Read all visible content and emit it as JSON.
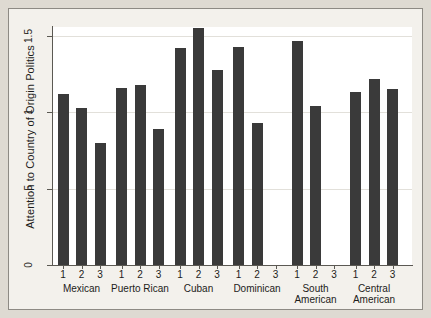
{
  "chart_data": {
    "type": "bar",
    "title": "",
    "subtitle": "",
    "xlabel": "",
    "ylabel": "Attention to Country of Origin Politics",
    "ylim": [
      0,
      1.65
    ],
    "ytick_values": [
      0,
      0.5,
      1,
      1.5
    ],
    "ytick_labels": [
      "0",
      ".5",
      "1",
      "1.5"
    ],
    "grid": "horizontal",
    "legend": "none",
    "bar_color": "#3a3a3a",
    "plot_background": "#ffffff",
    "figure_background": "#dedad2",
    "panel_background": "#f3f1ec",
    "categories": [
      "Mexican",
      "Puerto Rican",
      "Cuban",
      "Dominican",
      "South American",
      "Central American"
    ],
    "subcategories": [
      "1",
      "2",
      "3"
    ],
    "groups": [
      {
        "label": "Mexican",
        "label_lines": [
          "Mexican"
        ],
        "bars": [
          {
            "tick": "1",
            "value": 1.12
          },
          {
            "tick": "2",
            "value": 1.03
          },
          {
            "tick": "3",
            "value": 0.8
          }
        ]
      },
      {
        "label": "Puerto Rican",
        "label_lines": [
          "Puerto Rican"
        ],
        "bars": [
          {
            "tick": "1",
            "value": 1.16
          },
          {
            "tick": "2",
            "value": 1.18
          },
          {
            "tick": "3",
            "value": 0.89
          }
        ]
      },
      {
        "label": "Cuban",
        "label_lines": [
          "Cuban"
        ],
        "bars": [
          {
            "tick": "1",
            "value": 1.42
          },
          {
            "tick": "2",
            "value": 1.55
          },
          {
            "tick": "3",
            "value": 1.28
          }
        ]
      },
      {
        "label": "Dominican",
        "label_lines": [
          "Dominican"
        ],
        "bars": [
          {
            "tick": "1",
            "value": 1.43
          },
          {
            "tick": "2",
            "value": 0.93
          },
          {
            "tick": "3",
            "value": null
          }
        ]
      },
      {
        "label": "South American",
        "label_lines": [
          "South",
          "American"
        ],
        "bars": [
          {
            "tick": "1",
            "value": 1.47
          },
          {
            "tick": "2",
            "value": 1.04
          },
          {
            "tick": "3",
            "value": null
          }
        ]
      },
      {
        "label": "Central American",
        "label_lines": [
          "Central",
          "American"
        ],
        "bars": [
          {
            "tick": "1",
            "value": 1.13
          },
          {
            "tick": "2",
            "value": 1.22
          },
          {
            "tick": "3",
            "value": 1.15
          }
        ]
      }
    ]
  },
  "layout": {
    "plot_left": 53,
    "plot_right": 412,
    "baseline_y": 265,
    "px_per_unit": 152.7,
    "bar_width": 11,
    "group_pitch": 58.5,
    "first_group_center": 81.5,
    "bar_pitch": 18.5
  }
}
